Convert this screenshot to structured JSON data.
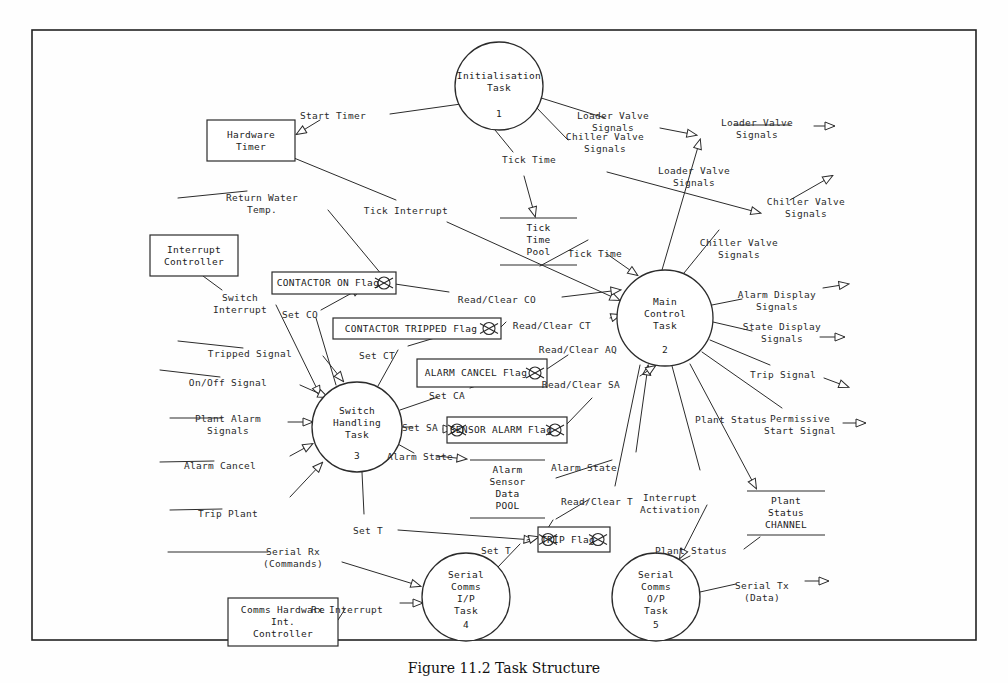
{
  "figure": {
    "caption": "Figure 11.2   Task Structure",
    "border_color": "#222222",
    "line_color": "#2b2b2b"
  },
  "processes": [
    {
      "id": "p1",
      "name": "Initialisation\nTask",
      "number": "1",
      "cx": 499,
      "cy": 86,
      "r": 44
    },
    {
      "id": "p2",
      "name": "Main\nControl\nTask",
      "number": "2",
      "cx": 665,
      "cy": 318,
      "r": 48
    },
    {
      "id": "p3",
      "name": "Switch\nHandling\nTask",
      "number": "3",
      "cx": 357,
      "cy": 427,
      "r": 45
    },
    {
      "id": "p4",
      "name": "Serial\nComms\nI/P\nTask",
      "number": "4",
      "cx": 466,
      "cy": 597,
      "r": 44
    },
    {
      "id": "p5",
      "name": "Serial\nComms\nO/P\nTask",
      "number": "5",
      "cx": 656,
      "cy": 597,
      "r": 44
    }
  ],
  "terminators": [
    {
      "id": "t1",
      "label": "Hardware\nTimer",
      "x": 207,
      "y": 120,
      "w": 88,
      "h": 41
    },
    {
      "id": "t2",
      "label": "Interrupt\nController",
      "x": 150,
      "y": 235,
      "w": 88,
      "h": 41
    },
    {
      "id": "t3",
      "label": "Comms Hardware\nInt.\nController",
      "x": 228,
      "y": 598,
      "w": 110,
      "h": 48
    }
  ],
  "flags": [
    {
      "id": "f1",
      "label": "CONTACTOR ON Flag",
      "x": 272,
      "y": 272,
      "w": 124,
      "h": 22
    },
    {
      "id": "f2",
      "label": "CONTACTOR TRIPPED Flag",
      "x": 333,
      "y": 318,
      "w": 168,
      "h": 21
    },
    {
      "id": "f3",
      "label": "ALARM CANCEL Flag",
      "x": 417,
      "y": 359,
      "w": 130,
      "h": 28
    },
    {
      "id": "f4",
      "label": "SENSOR ALARM Flag",
      "x": 447,
      "y": 417,
      "w": 120,
      "h": 26
    },
    {
      "id": "f5",
      "label": "TRIP Flag",
      "x": 538,
      "y": 527,
      "w": 72,
      "h": 25
    }
  ],
  "stores": [
    {
      "id": "s1",
      "label": "Tick\nTime\nPool",
      "x1": 500,
      "x2": 577,
      "ytop": 218,
      "ybot": 265
    },
    {
      "id": "s2",
      "label": "Alarm\nSensor\nData\nPOOL",
      "x1": 470,
      "x2": 545,
      "ytop": 460,
      "ybot": 518
    },
    {
      "id": "s3",
      "label": "Plant\nStatus\nCHANNEL",
      "x1": 747,
      "x2": 825,
      "ytop": 491,
      "ybot": 535
    }
  ],
  "flow_labels": [
    {
      "id": "fl_start_timer",
      "text": "Start Timer",
      "x": 333,
      "y": 110
    },
    {
      "id": "fl_loader_valve_1",
      "text": "Loader Valve\nSignals",
      "x": 613,
      "y": 110
    },
    {
      "id": "fl_chiller_valve_1",
      "text": "Chiller Valve\nSignals",
      "x": 605,
      "y": 131
    },
    {
      "id": "fl_loader_valve_out",
      "text": "Loader Valve\nSignals",
      "x": 757,
      "y": 117
    },
    {
      "id": "fl_tick_time_1",
      "text": "Tick Time",
      "x": 529,
      "y": 154
    },
    {
      "id": "fl_loader_valve_2",
      "text": "Loader Valve\nSignals",
      "x": 694,
      "y": 165
    },
    {
      "id": "fl_chiller_valve_out",
      "text": "Chiller Valve\nSignals",
      "x": 806,
      "y": 196
    },
    {
      "id": "fl_return_water",
      "text": "Return Water\nTemp.",
      "x": 262,
      "y": 192
    },
    {
      "id": "fl_tick_interrupt",
      "text": "Tick Interrupt",
      "x": 406,
      "y": 205
    },
    {
      "id": "fl_chiller_valve_2",
      "text": "Chiller Valve\nSignals",
      "x": 739,
      "y": 237
    },
    {
      "id": "fl_tick_time_2",
      "text": "Tick Time",
      "x": 595,
      "y": 248
    },
    {
      "id": "fl_switch_interrupt",
      "text": "Switch\nInterrupt",
      "x": 240,
      "y": 292
    },
    {
      "id": "fl_readclear_co",
      "text": "Read/Clear CO",
      "x": 497,
      "y": 294
    },
    {
      "id": "fl_alarm_display",
      "text": "Alarm Display\nSignals",
      "x": 777,
      "y": 289
    },
    {
      "id": "fl_set_co",
      "text": "Set CO",
      "x": 300,
      "y": 309
    },
    {
      "id": "fl_readclear_ct",
      "text": "Read/Clear CT",
      "x": 552,
      "y": 320
    },
    {
      "id": "fl_state_display",
      "text": "State Display\nSignals",
      "x": 782,
      "y": 321
    },
    {
      "id": "fl_tripped_signal",
      "text": "Tripped Signal",
      "x": 250,
      "y": 348
    },
    {
      "id": "fl_set_ct",
      "text": "Set CT",
      "x": 377,
      "y": 350
    },
    {
      "id": "fl_readclear_aq",
      "text": "Read/Clear AQ",
      "x": 578,
      "y": 344
    },
    {
      "id": "fl_onoff_signal",
      "text": "On/Off Signal",
      "x": 228,
      "y": 377
    },
    {
      "id": "fl_trip_signal",
      "text": "Trip Signal",
      "x": 783,
      "y": 369
    },
    {
      "id": "fl_readclear_sa",
      "text": "Read/Clear SA",
      "x": 581,
      "y": 379
    },
    {
      "id": "fl_set_ca",
      "text": "Set CA",
      "x": 447,
      "y": 390
    },
    {
      "id": "fl_plant_alarm",
      "text": "Plant Alarm\nSignals",
      "x": 228,
      "y": 413
    },
    {
      "id": "fl_set_sa",
      "text": "Set SA",
      "x": 420,
      "y": 422
    },
    {
      "id": "fl_plant_status_1",
      "text": "Plant Status",
      "x": 731,
      "y": 414
    },
    {
      "id": "fl_permissive",
      "text": "Permissive\nStart Signal",
      "x": 800,
      "y": 413
    },
    {
      "id": "fl_alarm_cancel",
      "text": "Alarm Cancel",
      "x": 220,
      "y": 460
    },
    {
      "id": "fl_alarm_state_1",
      "text": "Alarm State",
      "x": 420,
      "y": 451
    },
    {
      "id": "fl_alarm_state_2",
      "text": "Alarm State",
      "x": 584,
      "y": 462
    },
    {
      "id": "fl_trip_plant",
      "text": "Trip Plant",
      "x": 228,
      "y": 508
    },
    {
      "id": "fl_readclear_t",
      "text": "Read/Clear T",
      "x": 597,
      "y": 496
    },
    {
      "id": "fl_interrupt_act",
      "text": "Interrupt\nActivation",
      "x": 670,
      "y": 492
    },
    {
      "id": "fl_set_t",
      "text": "Set T",
      "x": 368,
      "y": 525
    },
    {
      "id": "fl_serial_rx",
      "text": "Serial Rx\n(Commands)",
      "x": 293,
      "y": 546
    },
    {
      "id": "fl_set_t2",
      "text": "Set T",
      "x": 496,
      "y": 545
    },
    {
      "id": "fl_plant_status_2",
      "text": "Plant Status",
      "x": 691,
      "y": 545
    },
    {
      "id": "fl_rx_interrupt",
      "text": "Rx Interrupt",
      "x": 347,
      "y": 604
    },
    {
      "id": "fl_serial_tx",
      "text": "Serial Tx\n(Data)",
      "x": 762,
      "y": 580
    }
  ]
}
